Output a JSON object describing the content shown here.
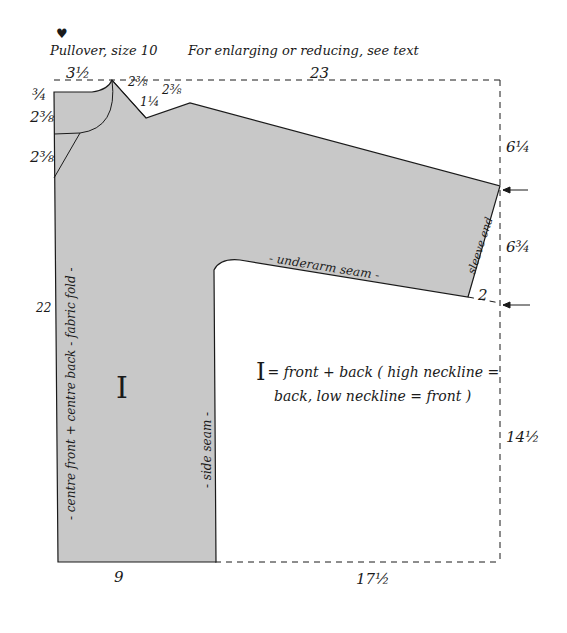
{
  "title": {
    "heart_icon": "♥",
    "pattern_name": "Pullover, size 10",
    "note": "For enlarging or reducing, see text"
  },
  "colors": {
    "fabric_fill": "#c8c8c8",
    "outline": "#1a1a1a",
    "background": "#ffffff"
  },
  "measurements": {
    "neck_width": "3½",
    "overall_width": "23",
    "shoulder_slope_left": "2⅜",
    "dart_depth": "1¼",
    "shoulder_slope_right": "2⅜",
    "top_drop": "¾",
    "high_neck_depth": "2⅜",
    "low_neck_depth": "2⅜",
    "sleeve_drop": "6¼",
    "sleeve_end": "6¾",
    "sleeve_offset": "2",
    "total_length": "22",
    "body_length": "14½",
    "body_width": "9",
    "sleeve_width_offset": "17½"
  },
  "labels": {
    "center_fold": "- centre front + centre back - fabric fold -",
    "side_seam": "- side seam -",
    "underarm_seam": "- underarm seam -",
    "sleeve_end": "sleeve end",
    "piece_mark": "I"
  },
  "legend": {
    "mark": "I",
    "line1": "= front + back ( high neckline =",
    "line2": "back, low neckline = front )"
  }
}
